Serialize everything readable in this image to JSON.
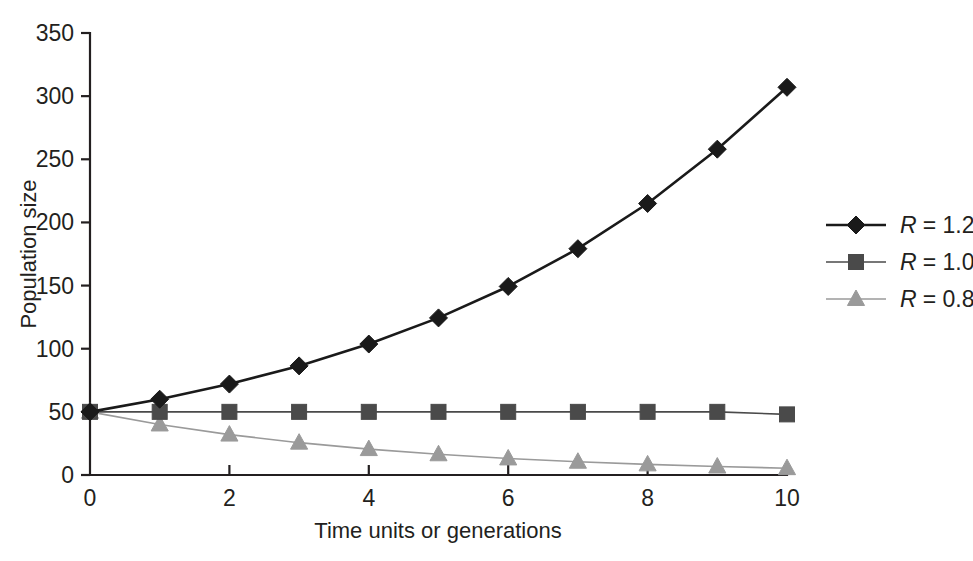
{
  "chart_data": {
    "type": "line",
    "title": "",
    "xlabel": "Time units or generations",
    "ylabel": "Population size",
    "x": [
      0,
      1,
      2,
      3,
      4,
      5,
      6,
      7,
      8,
      9,
      10
    ],
    "xlim": [
      0,
      10
    ],
    "ylim": [
      0,
      350
    ],
    "xticks": [
      "0",
      "2",
      "4",
      "6",
      "8",
      "10"
    ],
    "xtick_values": [
      0,
      2,
      4,
      6,
      8,
      10
    ],
    "yticks": [
      "0",
      "50",
      "100",
      "150",
      "200",
      "250",
      "300",
      "350"
    ],
    "ytick_values": [
      0,
      50,
      100,
      150,
      200,
      250,
      300,
      350
    ],
    "grid": false,
    "legend_position": "right",
    "series": [
      {
        "name": "R = 1.2",
        "label_prefix": "R",
        "label_value": "= 1.2",
        "marker": "diamond",
        "color": "#1a1a1a",
        "line_width": 2.6,
        "values": [
          50,
          60,
          72,
          86.4,
          103.7,
          124.4,
          149.3,
          179.2,
          215,
          258,
          307
        ]
      },
      {
        "name": "R = 1.0",
        "label_prefix": "R",
        "label_value": "= 1.0",
        "marker": "square",
        "color": "#4a4a4a",
        "line_width": 1.6,
        "values": [
          50,
          50,
          50,
          50,
          50,
          50,
          50,
          50,
          50,
          50,
          48
        ]
      },
      {
        "name": "R = 0.8",
        "label_prefix": "R",
        "label_value": "= 0.8",
        "marker": "triangle",
        "color": "#9a9a9a",
        "line_width": 1.6,
        "values": [
          50,
          40,
          32,
          25.6,
          20.5,
          16.4,
          13.1,
          10.5,
          8.4,
          6.7,
          5.4
        ]
      }
    ]
  },
  "axes": {
    "y_axis_title": "Population size",
    "x_axis_title": "Time units or generations"
  },
  "legend": {
    "entries": [
      {
        "label": "R = 1.2",
        "r_symbol": "R",
        "equals_value": "= 1.2"
      },
      {
        "label": "R = 1.0",
        "r_symbol": "R",
        "equals_value": "= 1.0"
      },
      {
        "label": "R = 0.8",
        "r_symbol": "R",
        "equals_value": "= 0.8"
      }
    ]
  },
  "colors": {
    "series_1": "#1a1a1a",
    "series_2": "#4a4a4a",
    "series_3": "#9a9a9a",
    "axis": "#231f20",
    "background": "#ffffff"
  }
}
